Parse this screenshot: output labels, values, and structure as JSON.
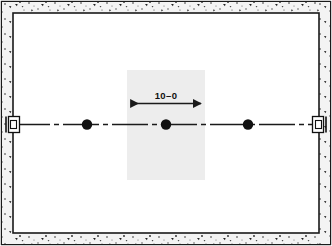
{
  "drawing": {
    "title": "architectural-floor-plan-fragment",
    "background_color": "#ffffff",
    "outer_frame": {
      "stroke_color": "#1a1a1a",
      "x": 1,
      "y": 1,
      "width": 330,
      "height": 244
    },
    "wall": {
      "name": "hatched-concrete-wall-band",
      "fill_color": "#f2f2f2",
      "speckle_color": "#2b2b2b",
      "band_thickness": 10,
      "inner_rect": {
        "x": 11,
        "y": 11,
        "width": 310,
        "height": 224
      },
      "inner_stroke_color": "#1a1a1a"
    },
    "shaded_zone": {
      "name": "highlight-overlay",
      "fill_color": "#ededed",
      "x": 127,
      "y": 70,
      "width": 78,
      "height": 110
    },
    "centerline": {
      "name": "horizontal-centerline",
      "stroke_color": "#1a1a1a",
      "y": 124,
      "x_start": 14,
      "x_end": 318,
      "pattern": "dash-dot",
      "dash_array": "34 4 5 4"
    },
    "fixture_points": [
      {
        "label": "left-fixture-point",
        "x": 87,
        "y": 124,
        "radius": 5.2
      },
      {
        "label": "center-fixture-point",
        "x": 166,
        "y": 124,
        "radius": 5.2
      },
      {
        "label": "right-fixture-point",
        "x": 248,
        "y": 124,
        "radius": 5.2
      }
    ],
    "wall_brackets": [
      {
        "label": "left-wall-bracket",
        "x": 8,
        "y": 116,
        "width": 12,
        "height": 16
      },
      {
        "label": "right-wall-bracket",
        "x": 312,
        "y": 116,
        "width": 12,
        "height": 16
      }
    ],
    "dimension": {
      "name": "span-dimension",
      "text": "10–0",
      "text_x": 166,
      "text_y": 100,
      "line_y": 103,
      "x_start": 128,
      "x_end": 204,
      "stroke_color": "#1a1a1a",
      "arrow_size": 5
    }
  }
}
